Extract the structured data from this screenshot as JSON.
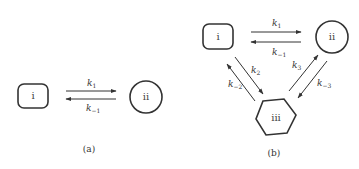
{
  "diagram_a": {
    "caption": "(a)",
    "nodes": [
      {
        "id": "i",
        "label": "i",
        "shape": "rounded-square"
      },
      {
        "id": "ii",
        "label": "ii",
        "shape": "circle"
      }
    ],
    "edges": [
      {
        "from": "i",
        "to": "ii",
        "rate": "k",
        "sub": "1"
      },
      {
        "from": "ii",
        "to": "i",
        "rate": "k",
        "sub": "−1"
      }
    ]
  },
  "diagram_b": {
    "caption": "(b)",
    "nodes": [
      {
        "id": "i",
        "label": "i",
        "shape": "rounded-square"
      },
      {
        "id": "ii",
        "label": "ii",
        "shape": "circle"
      },
      {
        "id": "iii",
        "label": "iii",
        "shape": "hexagon"
      }
    ],
    "edges": [
      {
        "from": "i",
        "to": "ii",
        "rate": "k",
        "sub": "1"
      },
      {
        "from": "ii",
        "to": "i",
        "rate": "k",
        "sub": "−1"
      },
      {
        "from": "i",
        "to": "iii",
        "rate": "k",
        "sub": "2"
      },
      {
        "from": "iii",
        "to": "i",
        "rate": "k",
        "sub": "−2"
      },
      {
        "from": "iii",
        "to": "ii",
        "rate": "k",
        "sub": "3"
      },
      {
        "from": "ii",
        "to": "iii",
        "rate": "k",
        "sub": "−3"
      }
    ]
  },
  "colors": {
    "stroke": "#333333",
    "background": "#ffffff"
  }
}
